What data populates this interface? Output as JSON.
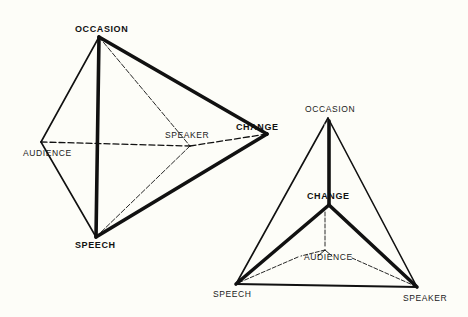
{
  "colors": {
    "background": "#fdfdf8",
    "ink": "#111111"
  },
  "diagrams": [
    {
      "id": "tetrahedron-left",
      "labels": {
        "occasion": "OCCASION",
        "audience": "AUDIENCE",
        "speaker": "SPEAKER",
        "change": "CHANGE",
        "speech": "SPEECH"
      },
      "emphasized": [
        "OCCASION",
        "CHANGE",
        "SPEECH"
      ]
    },
    {
      "id": "tetrahedron-right",
      "labels": {
        "occasion": "OCCASION",
        "change": "CHANGE",
        "audience": "AUDIENCE",
        "speech": "SPEECH",
        "speaker": "SPEAKER"
      },
      "emphasized": [
        "CHANGE"
      ]
    }
  ]
}
